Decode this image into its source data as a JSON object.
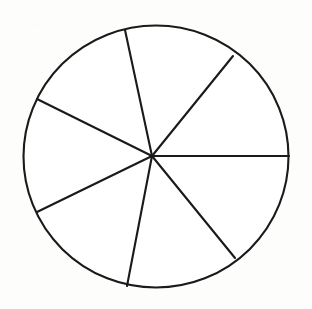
{
  "figure": {
    "background_color": "#fdfdfc",
    "canvas": {
      "width": 312,
      "height": 309
    }
  },
  "chart_data": {
    "type": "pie",
    "xlabel": "",
    "ylabel": "",
    "grid": false,
    "legend": "none",
    "labels_shown": false,
    "center": {
      "x": 152,
      "y": 156
    },
    "radius": 133,
    "stroke_color": "#1a1a1a",
    "stroke_width": 2.1,
    "fill_color": "#ffffff",
    "slice_count": 7,
    "categories": [
      "sector-1",
      "sector-2",
      "sector-3",
      "sector-4",
      "sector-5",
      "sector-6",
      "sector-7"
    ],
    "values": [
      51,
      51,
      52,
      52,
      53,
      50,
      51
    ],
    "boundary_angles_deg": [
      0,
      51,
      102,
      154,
      206,
      259,
      309
    ],
    "spokes": [
      {
        "name": "spoke-east",
        "angle_deg": 0,
        "end_x": 289,
        "end_y": 156
      },
      {
        "name": "spoke-northeast",
        "angle_deg": 51,
        "end_x": 233,
        "end_y": 56
      },
      {
        "name": "spoke-north",
        "angle_deg": 102,
        "end_x": 125,
        "end_y": 30
      },
      {
        "name": "spoke-northwest",
        "angle_deg": 154,
        "end_x": 37,
        "end_y": 99
      },
      {
        "name": "spoke-southwest",
        "angle_deg": 206,
        "end_x": 37,
        "end_y": 212
      },
      {
        "name": "spoke-south",
        "angle_deg": 259,
        "end_x": 127,
        "end_y": 286
      },
      {
        "name": "spoke-southeast",
        "angle_deg": 309,
        "end_x": 235,
        "end_y": 258
      }
    ]
  }
}
